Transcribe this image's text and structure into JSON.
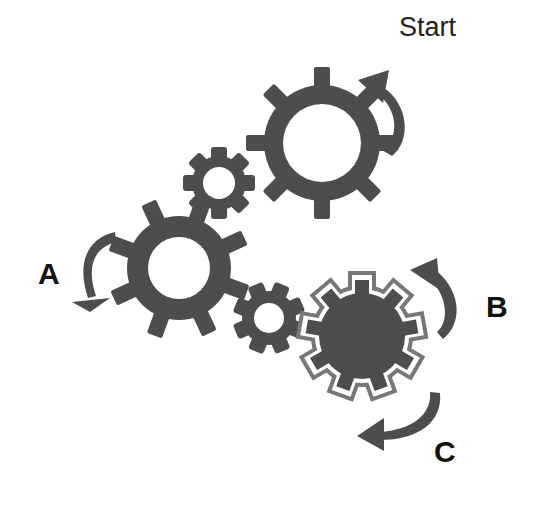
{
  "diagram": {
    "colors": {
      "gear": "#4d4d4d",
      "background": "#ffffff",
      "text": "#111111"
    },
    "labels": {
      "start": "Start",
      "a": "A",
      "b": "B",
      "c": "C"
    },
    "gears": [
      {
        "id": "top-large",
        "type": "ring",
        "teeth": 8
      },
      {
        "id": "top-small",
        "type": "ring",
        "teeth": 8
      },
      {
        "id": "left-large",
        "type": "ring",
        "teeth": 8
      },
      {
        "id": "bottom-small",
        "type": "ring",
        "teeth": 8
      },
      {
        "id": "solid-outlined",
        "type": "solid",
        "teeth": 9
      }
    ],
    "arrows": [
      {
        "id": "start-arrow",
        "direction": "counter-clockwise"
      },
      {
        "id": "a-arrow",
        "direction": "counter-clockwise"
      },
      {
        "id": "b-arrow",
        "direction": "counter-clockwise"
      },
      {
        "id": "c-arrow",
        "direction": "clockwise"
      }
    ]
  }
}
